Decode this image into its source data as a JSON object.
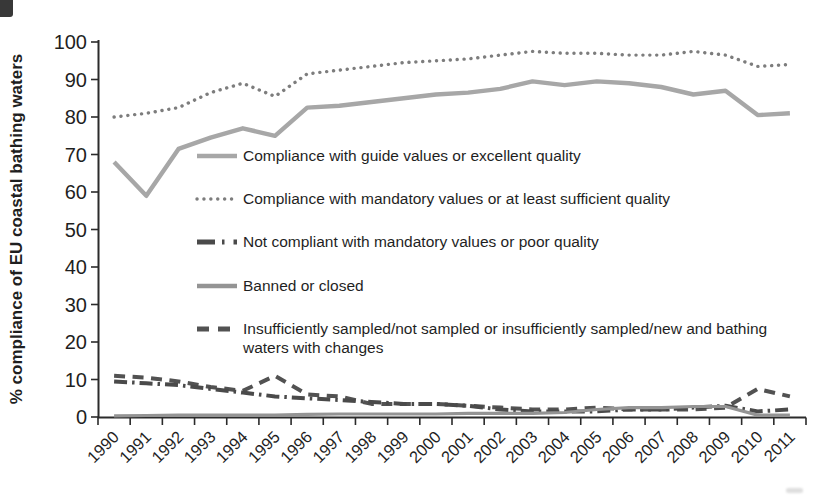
{
  "page": {
    "background": "#ffffff",
    "axis_color": "#2b2b2b",
    "text_color": "#1f1f1f"
  },
  "chart_data": {
    "type": "line",
    "title": "",
    "xlabel": "",
    "ylabel": "% compliance of EU coastal bathing waters",
    "ylim": [
      0,
      100
    ],
    "ytick_step": 10,
    "yticks": [
      "0",
      "10",
      "20",
      "30",
      "40",
      "50",
      "60",
      "70",
      "80",
      "90",
      "100"
    ],
    "grid": false,
    "legend_position": "inside-left",
    "categories": [
      "1990",
      "1991",
      "1992",
      "1993",
      "1994",
      "1995",
      "1996",
      "1997",
      "1998",
      "1999",
      "2000",
      "2001",
      "2002",
      "2003",
      "2004",
      "2005",
      "2006",
      "2007",
      "2008",
      "2009",
      "2010",
      "2011"
    ],
    "series": [
      {
        "name": "Compliance with guide values or excellent quality",
        "line_style": "solid",
        "color": "#a7a7a7",
        "values": [
          68,
          59,
          71.5,
          74.5,
          77,
          75,
          82.5,
          83,
          84,
          85,
          86,
          86.5,
          87.5,
          89.5,
          88.5,
          89.5,
          89,
          88,
          86,
          87,
          80.5,
          81
        ]
      },
      {
        "name": "Compliance with mandatory values or at least sufficient quality",
        "line_style": "dotted",
        "color": "#7d7d7d",
        "values": [
          80,
          81,
          82.5,
          86.5,
          89,
          85.5,
          91.5,
          92.5,
          93.5,
          94.5,
          95,
          95.5,
          96.5,
          97.5,
          97,
          97,
          96.5,
          96.5,
          97.5,
          96.5,
          93.5,
          94
        ]
      },
      {
        "name": "Not compliant with mandatory values or poor quality",
        "line_style": "dash-dot",
        "color": "#4a4a4a",
        "values": [
          9.5,
          9,
          8.5,
          7.5,
          6.5,
          5.5,
          5,
          4.5,
          4,
          3.5,
          3.5,
          3,
          2,
          1.5,
          1.5,
          1.5,
          2,
          2,
          2.5,
          3,
          1.5,
          2
        ]
      },
      {
        "name": "Banned or closed",
        "line_style": "solid",
        "color": "#949494",
        "values": [
          0.3,
          0.4,
          0.5,
          0.5,
          0.5,
          0.5,
          0.7,
          0.8,
          0.8,
          0.8,
          0.8,
          1,
          1,
          1,
          1.2,
          2,
          2.5,
          2.5,
          2.8,
          2.8,
          0.5,
          0.5
        ]
      },
      {
        "name": "Insufficiently sampled/not sampled or insufficiently sampled/new and bathing waters with changes",
        "line_style": "dashed",
        "color": "#525252",
        "values": [
          11,
          10.5,
          9.5,
          8,
          7,
          11,
          6,
          5.5,
          3.5,
          3.5,
          3.5,
          3,
          2.5,
          2,
          2,
          2.5,
          2,
          2,
          2,
          2.5,
          7.5,
          5.5
        ]
      }
    ],
    "legend": {
      "items": [
        {
          "series_index": 0,
          "lines": [
            "Compliance with guide values or excellent quality"
          ]
        },
        {
          "series_index": 1,
          "lines": [
            "Compliance with mandatory values or at least sufficient quality"
          ]
        },
        {
          "series_index": 2,
          "lines": [
            "Not compliant with mandatory values or poor quality"
          ]
        },
        {
          "series_index": 3,
          "lines": [
            "Banned or closed"
          ]
        },
        {
          "series_index": 4,
          "lines": [
            "Insufficiently sampled/not sampled or insufficiently sampled/new and bathing",
            "waters with changes"
          ]
        }
      ]
    }
  }
}
